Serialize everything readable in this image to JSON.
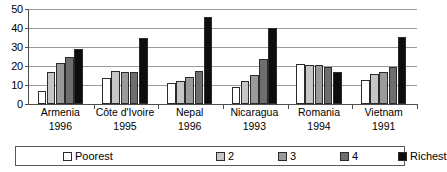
{
  "chart_data": {
    "type": "bar",
    "title": "",
    "xlabel": "",
    "ylabel": "",
    "ylim": [
      0,
      50
    ],
    "y_ticks": [
      0,
      10,
      20,
      30,
      40,
      50
    ],
    "grid": true,
    "legend_position": "bottom",
    "categories": [
      "Armenia\n1996",
      "Côte d'Ivoire\n1995",
      "Nepal\n1996",
      "Nicaragua\n1993",
      "Romania\n1994",
      "Vietnam\n1991"
    ],
    "category_names": [
      "Armenia",
      "Côte d'Ivoire",
      "Nepal",
      "Nicaragua",
      "Romania",
      "Vietnam"
    ],
    "category_years": [
      "1996",
      "1995",
      "1996",
      "1993",
      "1994",
      "1991"
    ],
    "series": [
      {
        "name": "Poorest",
        "color": "#ffffff",
        "values": [
          7.0,
          13.5,
          11.0,
          9.0,
          21.0,
          12.5
        ]
      },
      {
        "name": "2",
        "color": "#c6c6c6",
        "values": [
          17.0,
          17.5,
          12.0,
          12.0,
          20.5,
          16.0
        ]
      },
      {
        "name": "3",
        "color": "#9a9a9a",
        "values": [
          21.5,
          17.0,
          14.0,
          15.5,
          20.5,
          17.0
        ]
      },
      {
        "name": "4",
        "color": "#6e6e6e",
        "values": [
          24.5,
          17.0,
          17.5,
          23.5,
          19.5,
          19.5
        ]
      },
      {
        "name": "Richest",
        "color": "#0d0d0d",
        "values": [
          29.0,
          34.5,
          46.0,
          40.0,
          17.0,
          35.5
        ]
      }
    ]
  },
  "legend": {
    "items": [
      {
        "label": "Poorest",
        "color": "#ffffff"
      },
      {
        "label": "2",
        "color": "#c6c6c6"
      },
      {
        "label": "3",
        "color": "#9a9a9a"
      },
      {
        "label": "4",
        "color": "#6e6e6e"
      },
      {
        "label": "Richest",
        "color": "#0d0d0d"
      }
    ]
  },
  "axis": {
    "y_tick_labels": [
      "0",
      "10",
      "20",
      "30",
      "40",
      "50"
    ]
  }
}
